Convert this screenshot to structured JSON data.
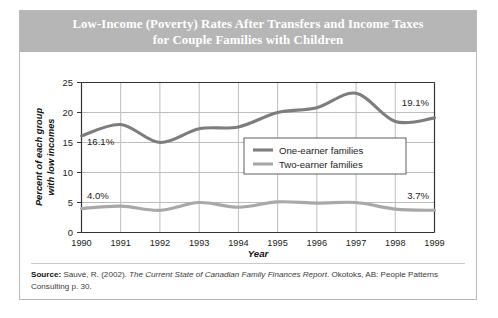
{
  "card": {
    "title": "Low-Income (Poverty) Rates After Transfers and Income Taxes for Couple Families with Children",
    "title_line1": "Low-Income (Poverty) Rates After Transfers and Income Taxes",
    "title_line2": "for Couple Families with Children"
  },
  "source": {
    "label": "Source:",
    "text_before_italic": " Sauvé, R. (2002). ",
    "italic_title": "The Current State of Canadian Family Finances Report",
    "text_after_italic": ". Okotoks, AB: People Patterns Consulting p. 30."
  },
  "colors": {
    "title_band": "#b6b6b6",
    "one_earner_line": "#7d7d7d",
    "two_earner_line": "#a8a8a8",
    "grid": "#bdbdbd",
    "axis": "#333333",
    "card_border": "#b9b9b9"
  },
  "chart_data": {
    "type": "line",
    "title": "Low-Income (Poverty) Rates After Transfers and Income Taxes for Couple Families with Children",
    "xlabel": "Year",
    "ylabel": "Percent of each group with low incomes",
    "ylabel_line1": "Percent of each group",
    "ylabel_line2": "with low incomes",
    "categories": [
      "1990",
      "1991",
      "1992",
      "1993",
      "1994",
      "1995",
      "1996",
      "1997",
      "1998",
      "1999"
    ],
    "x": [
      1990,
      1991,
      1992,
      1993,
      1994,
      1995,
      1996,
      1997,
      1998,
      1999
    ],
    "xlim": [
      1990,
      1999
    ],
    "ylim": [
      0,
      25
    ],
    "yticks": [
      0,
      5,
      10,
      15,
      20,
      25
    ],
    "grid": true,
    "legend_position": "center-right",
    "series": [
      {
        "name": "One-earner families",
        "color": "#7d7d7d",
        "values": [
          16.1,
          18.0,
          15.0,
          17.3,
          17.6,
          20.0,
          20.8,
          23.2,
          18.5,
          19.1
        ]
      },
      {
        "name": "Two-earner families",
        "color": "#a8a8a8",
        "values": [
          4.0,
          4.4,
          3.7,
          5.0,
          4.2,
          5.1,
          4.9,
          5.0,
          3.9,
          3.7
        ]
      }
    ],
    "annotations": [
      {
        "text": "16.1%",
        "series": "One-earner families",
        "year": 1990,
        "value": 16.1,
        "placement": "above-right"
      },
      {
        "text": "19.1%",
        "series": "One-earner families",
        "year": 1999,
        "value": 19.1,
        "placement": "above-left"
      },
      {
        "text": "4.0%",
        "series": "Two-earner families",
        "year": 1990,
        "value": 4.0,
        "placement": "above-right"
      },
      {
        "text": "3.7%",
        "series": "Two-earner families",
        "year": 1999,
        "value": 3.7,
        "placement": "above-left"
      }
    ]
  }
}
